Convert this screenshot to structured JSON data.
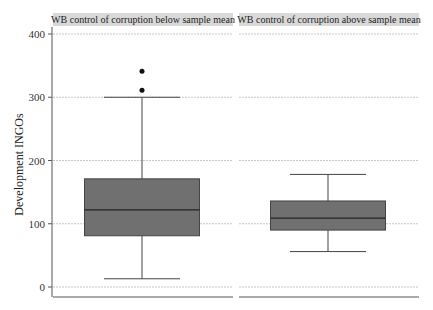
{
  "chart_data": {
    "type": "boxplot",
    "title": "",
    "xlabel": "",
    "ylabel": "Development INGOs",
    "ylim": [
      0,
      400
    ],
    "yticks": [
      0,
      100,
      200,
      300,
      400
    ],
    "grid": "horizontal dotted",
    "legend": "none",
    "panels": [
      {
        "label": "WB control of corruption below sample mean",
        "box": {
          "whisker_low": 13,
          "q1": 81,
          "median": 122,
          "q3": 171,
          "whisker_high": 300
        },
        "outliers": [
          311,
          341
        ]
      },
      {
        "label": "WB control of corruption above sample mean",
        "box": {
          "whisker_low": 56,
          "q1": 90,
          "median": 109,
          "q3": 136,
          "whisker_high": 178
        },
        "outliers": []
      }
    ],
    "colors": {
      "box_fill": "#707070",
      "strip_bg": "#d9d9d9",
      "grid": "#c8c8c8"
    }
  }
}
